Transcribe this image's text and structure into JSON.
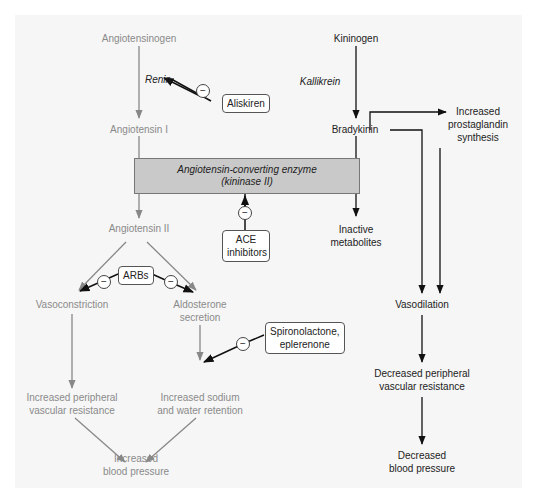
{
  "diagram": {
    "left_pathway": {
      "angiotensinogen": "Angiotensinogen",
      "renin": "Renin",
      "angiotensin_i": "Angiotensin I",
      "angiotensin_ii": "Angiotensin II",
      "vasoconstriction": "Vasoconstriction",
      "aldosterone_line1": "Aldosterone",
      "aldosterone_line2": "secretion",
      "ipvr_line1": "Increased peripheral",
      "ipvr_line2": "vascular resistance",
      "sodium_line1": "Increased sodium",
      "sodium_line2": "and water retention",
      "ibp_line1": "Increased",
      "ibp_line2": "blood pressure"
    },
    "right_pathway": {
      "kininogen": "Kininogen",
      "kallikrein": "Kallikrein",
      "bradykinin": "Bradykinin",
      "prostaglandin_line1": "Increased",
      "prostaglandin_line2": "prostaglandin",
      "prostaglandin_line3": "synthesis",
      "inactive_line1": "Inactive",
      "inactive_line2": "metabolites",
      "vasodilation": "Vasodilation",
      "dpvr_line1": "Decreased peripheral",
      "dpvr_line2": "vascular resistance",
      "dbp_line1": "Decreased",
      "dbp_line2": "blood pressure"
    },
    "enzyme": {
      "line1": "Angiotensin-converting enzyme",
      "line2": "(kininase II)"
    },
    "drugs": {
      "aliskiren": "Aliskiren",
      "ace_line1": "ACE",
      "ace_line2": "inhibitors",
      "arbs": "ARBs",
      "spiro_line1": "Spironolactone,",
      "spiro_line2": "eplerenone"
    },
    "inhibition_symbol": "−",
    "colors": {
      "left_pathway": "#8a8a8a",
      "right_pathway": "#222222",
      "enzyme_box": "#c9c9c9",
      "panel": "#f6f6f6"
    }
  }
}
